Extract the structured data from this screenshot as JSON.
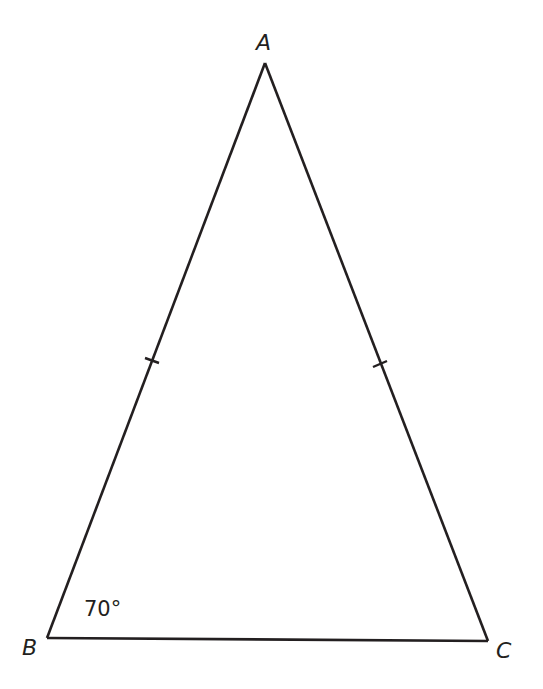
{
  "diagram": {
    "type": "isosceles-triangle",
    "stroke_color": "#231f20",
    "vertices": {
      "A": {
        "label": "A",
        "x": 265,
        "y": 63
      },
      "B": {
        "label": "B",
        "x": 47,
        "y": 638
      },
      "C": {
        "label": "C",
        "x": 488,
        "y": 641
      }
    },
    "labels": {
      "A": "A",
      "B": "B",
      "C": "C"
    },
    "angle_B": "70°",
    "congruence_marks": [
      "AB",
      "AC"
    ]
  }
}
